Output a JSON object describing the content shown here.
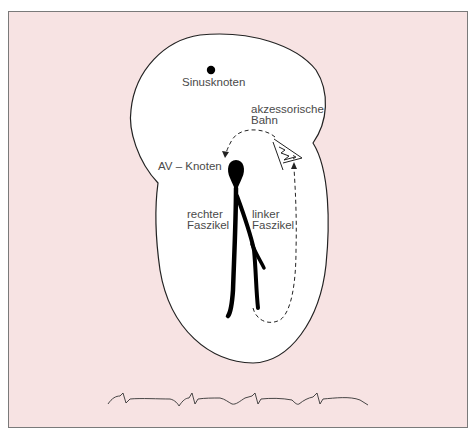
{
  "diagram": {
    "type": "heart-conduction-schematic",
    "colors": {
      "background": "#f7e3e3",
      "frame_border": "#7a7a7a",
      "heart_fill": "#ffffff",
      "outline": "#222222",
      "conduction": "#000000",
      "text": "#4a4a4a"
    },
    "labels": {
      "sinus_node": "Sinusknoten",
      "accessory_line1": "akzessorische",
      "accessory_line2": "Bahn",
      "av_node": "AV – Knoten",
      "right_bundle_line1": "rechter",
      "right_bundle_line2": "Faszikel",
      "left_bundle_line1": "linker",
      "left_bundle_line2": "Faszikel"
    },
    "elements": [
      {
        "name": "heart-outline",
        "shape": "closed-curve"
      },
      {
        "name": "sinus-node",
        "shape": "dot"
      },
      {
        "name": "av-node",
        "shape": "teardrop"
      },
      {
        "name": "right-bundle-branch",
        "shape": "thick-stroke"
      },
      {
        "name": "left-bundle-branch",
        "shape": "thick-stroke, forked"
      },
      {
        "name": "accessory-pathway",
        "shape": "triangle with zigzag arrows"
      },
      {
        "name": "reentry-loop",
        "shape": "dashed arrows (up from ventricle, over to AV node)"
      },
      {
        "name": "ecg-trace",
        "shape": "4 beats with short PR / delta wave"
      }
    ],
    "ecg": {
      "beats": 4
    }
  }
}
